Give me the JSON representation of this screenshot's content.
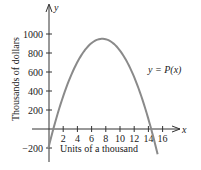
{
  "chart_data": {
    "type": "line",
    "title": "",
    "xlabel": "Units of a thousand",
    "ylabel": "Thousands of dollars",
    "x_axis_symbol": "x",
    "y_axis_symbol": "y",
    "curve_label": "y = P(x)",
    "xlim": [
      0,
      16
    ],
    "ylim": [
      -200,
      1000
    ],
    "x_ticks": [
      2,
      4,
      6,
      8,
      10,
      12,
      14,
      16
    ],
    "y_ticks": [
      -200,
      200,
      400,
      600,
      800,
      1000
    ],
    "x_tick_labels": [
      "2",
      "4",
      "6",
      "8",
      "10",
      "12",
      "14",
      "16"
    ],
    "y_tick_labels": [
      "−200",
      "200",
      "400",
      "600",
      "800",
      "1000"
    ],
    "grid": false,
    "legend": "none",
    "series": [
      {
        "name": "P(x)",
        "color": "#8a8a8a",
        "x": [
          0,
          0.6,
          1,
          2,
          3,
          4,
          5,
          6,
          7,
          7.5,
          8,
          9,
          10,
          11,
          12,
          13,
          14,
          14.4,
          15
        ],
        "y": [
          -175,
          0,
          105,
          345,
          545,
          705,
          825,
          905,
          945,
          950,
          945,
          905,
          825,
          705,
          545,
          345,
          105,
          0,
          -175
        ]
      }
    ]
  }
}
